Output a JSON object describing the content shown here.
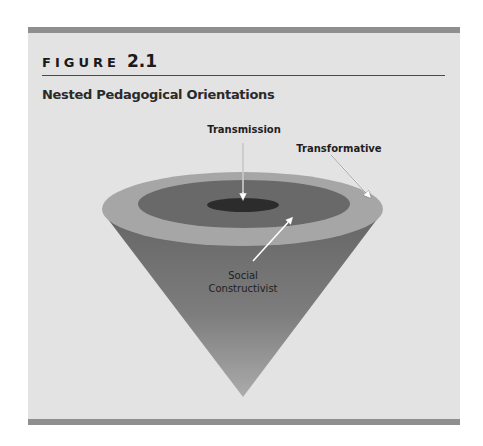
{
  "figure": {
    "label_word": "FIGURE",
    "label_number": "2.1",
    "title": "Nested Pedagogical Orientations"
  },
  "diagram": {
    "type": "nested-cone",
    "layers": [
      {
        "name": "Transformative",
        "role": "outer ring",
        "color": "#a6a6a6"
      },
      {
        "name": "Social Constructivist",
        "role": "middle ring",
        "color": "#696969"
      },
      {
        "name": "Transmission",
        "role": "inner core",
        "color": "#2e2e2e"
      }
    ],
    "labels": {
      "transmission": "Transmission",
      "transformative": "Transformative",
      "social_line1": "Social",
      "social_line2": "Constructivist"
    }
  },
  "colors": {
    "background": "#e3e3e3",
    "frame_bar": "#8f8f8f",
    "cone_top": "#6a6a6a",
    "cone_bottom": "#a8a8a8"
  }
}
